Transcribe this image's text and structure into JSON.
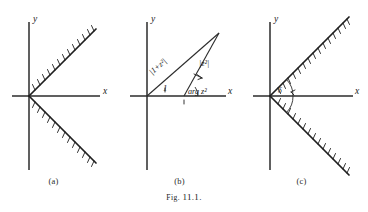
{
  "figure": {
    "caption_prefix": "Fig.",
    "caption_number": "11.1.",
    "caption_full": "Fig. 11.1."
  },
  "panels": [
    {
      "id": "a",
      "label": "(a)",
      "axes": {
        "x_label": "x",
        "y_label": "y"
      },
      "description": "Two hatched rays from origin at plus and minus 45 degrees opening toward positive x",
      "rays": [
        {
          "name": "upper-ray",
          "angle_deg": 45,
          "hatched": true,
          "hatch_side": "above"
        },
        {
          "name": "lower-ray",
          "angle_deg": -45,
          "hatched": true,
          "hatch_side": "below"
        }
      ]
    },
    {
      "id": "b",
      "label": "(b)",
      "axes": {
        "x_label": "x",
        "y_label": "y"
      },
      "description": "Triangle from origin showing vector sum with magnitude and argument labels",
      "labels": {
        "hypotenuse": "|1+z²|",
        "side": "|z²|",
        "base": "1",
        "angle": "arg z²"
      }
    },
    {
      "id": "c",
      "label": "(c)",
      "axes": {
        "x_label": "x",
        "y_label": "y"
      },
      "description": "Two hatched rays from origin at plus and minus 45 degrees with angle arcs measured from the positive x axis",
      "labels": {
        "angle": "δ"
      },
      "rays": [
        {
          "name": "upper-ray",
          "angle_deg": 45,
          "hatched": true,
          "hatch_side": "below"
        },
        {
          "name": "lower-ray",
          "angle_deg": -45,
          "hatched": true,
          "hatch_side": "above"
        }
      ]
    }
  ],
  "colors": {
    "background": "#ffffff",
    "ink": "#1e1e1e",
    "axis": "#2b2b2b"
  }
}
